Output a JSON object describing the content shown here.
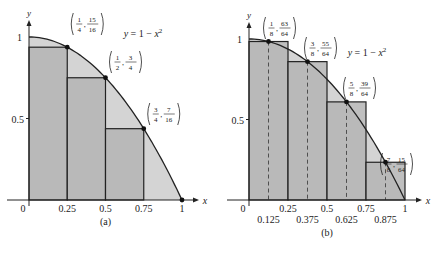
{
  "chart_data": [
    {
      "type": "area",
      "panel_label": "(a)",
      "function_label": "y = 1 − x²",
      "xlabel": "x",
      "ylabel": "y",
      "xlim": [
        0,
        1
      ],
      "ylim": [
        0,
        1
      ],
      "x_ticks": [
        "0",
        "0.25",
        "0.5",
        "0.75",
        "1"
      ],
      "y_ticks": [
        "0.5",
        "1"
      ],
      "rectangles": [
        {
          "x0": 0,
          "x1": 0.25,
          "height": 0.9375
        },
        {
          "x0": 0.25,
          "x1": 0.5,
          "height": 0.75
        },
        {
          "x0": 0.5,
          "x1": 0.75,
          "height": 0.4375
        },
        {
          "x0": 0.75,
          "x1": 1,
          "height": 0
        }
      ],
      "points": [
        {
          "x": 0.25,
          "y": 0.9375,
          "label_num_x": "1",
          "label_den_x": "4",
          "label_num_y": "15",
          "label_den_y": "16"
        },
        {
          "x": 0.5,
          "y": 0.75,
          "label_num_x": "1",
          "label_den_x": "2",
          "label_num_y": "3",
          "label_den_y": "4"
        },
        {
          "x": 0.75,
          "y": 0.4375,
          "label_num_x": "3",
          "label_den_x": "4",
          "label_num_y": "7",
          "label_den_y": "16"
        },
        {
          "x": 1,
          "y": 0
        }
      ]
    },
    {
      "type": "area",
      "panel_label": "(b)",
      "function_label": "y = 1 − x²",
      "xlabel": "x",
      "ylabel": "y",
      "xlim": [
        0,
        1
      ],
      "ylim": [
        0,
        1
      ],
      "x_ticks_upper": [
        "0",
        "0.25",
        "0.5",
        "0.75",
        "1"
      ],
      "x_ticks_lower": [
        "0.125",
        "0.375",
        "0.625",
        "0.875"
      ],
      "y_ticks": [
        "0.5",
        "1"
      ],
      "rectangles": [
        {
          "x0": 0,
          "x1": 0.25,
          "height": 0.984375
        },
        {
          "x0": 0.25,
          "x1": 0.5,
          "height": 0.859375
        },
        {
          "x0": 0.5,
          "x1": 0.75,
          "height": 0.609375
        },
        {
          "x0": 0.75,
          "x1": 1,
          "height": 0.234375
        }
      ],
      "points": [
        {
          "x": 0.125,
          "y": 0.984375,
          "label_num_x": "1",
          "label_den_x": "8",
          "label_num_y": "63",
          "label_den_y": "64"
        },
        {
          "x": 0.375,
          "y": 0.859375,
          "label_num_x": "3",
          "label_den_x": "8",
          "label_num_y": "55",
          "label_den_y": "64"
        },
        {
          "x": 0.625,
          "y": 0.609375,
          "label_num_x": "5",
          "label_den_x": "8",
          "label_num_y": "39",
          "label_den_y": "64"
        },
        {
          "x": 0.875,
          "y": 0.234375,
          "label_num_x": "7",
          "label_den_x": "8",
          "label_num_y": "15",
          "label_den_y": "64"
        }
      ]
    }
  ]
}
